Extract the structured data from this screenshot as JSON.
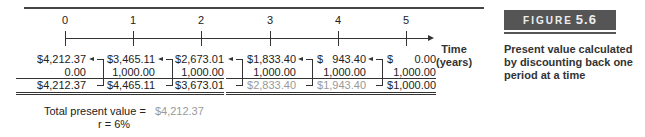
{
  "figure": {
    "label": "FIGURE",
    "number": "5.6",
    "caption": "Present value calculated by discounting back one period at a time"
  },
  "timeline": {
    "axis_label_line1": "Time",
    "axis_label_line2": "(years)",
    "periods": [
      "0",
      "1",
      "2",
      "3",
      "4",
      "5"
    ]
  },
  "columns": [
    {
      "period": "0",
      "pv": "$4,212.37",
      "cash_flow": "0.00",
      "total": "$4,212.37"
    },
    {
      "period": "1",
      "pv": "$3,465.11",
      "cash_flow": "1,000.00",
      "total": "$4,465.11"
    },
    {
      "period": "2",
      "pv": "$2,673.01",
      "cash_flow": "1,000.00",
      "total": "$3,673.01"
    },
    {
      "period": "3",
      "pv": "$1,833.40",
      "cash_flow": "1,000.00",
      "total": "$2,833.40"
    },
    {
      "period": "4",
      "pv": "$   943.40",
      "cash_flow": "1,000.00",
      "total": "$1,943.40"
    },
    {
      "period": "5",
      "pv": "$       0.00",
      "cash_flow": "1,000.00",
      "total": "$1,000.00"
    }
  ],
  "summary": {
    "total_label": "Total present value =",
    "total_value": "$4,212.37",
    "rate_label": "r = 6%"
  },
  "colors": {
    "figure_band": "#555555",
    "faded_value": "#999999",
    "text": "#222222"
  }
}
